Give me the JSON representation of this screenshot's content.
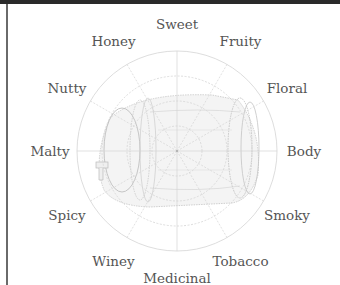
{
  "chart_data": {
    "type": "radar",
    "title": "",
    "axes": [
      "Sweet",
      "Fruity",
      "Floral",
      "Body",
      "Smoky",
      "Tobacco",
      "Medicinal",
      "Winey",
      "Spicy",
      "Malty",
      "Nutty",
      "Honey"
    ],
    "rings": 4,
    "range": [
      0,
      4
    ],
    "series": [],
    "background_illustration": "barrel",
    "grid": true,
    "legend": "none"
  },
  "colors": {
    "label": "#555555",
    "grid": "#d4d4d4",
    "barrel": "#bdbdbd",
    "frame": "#2a2a2a"
  }
}
